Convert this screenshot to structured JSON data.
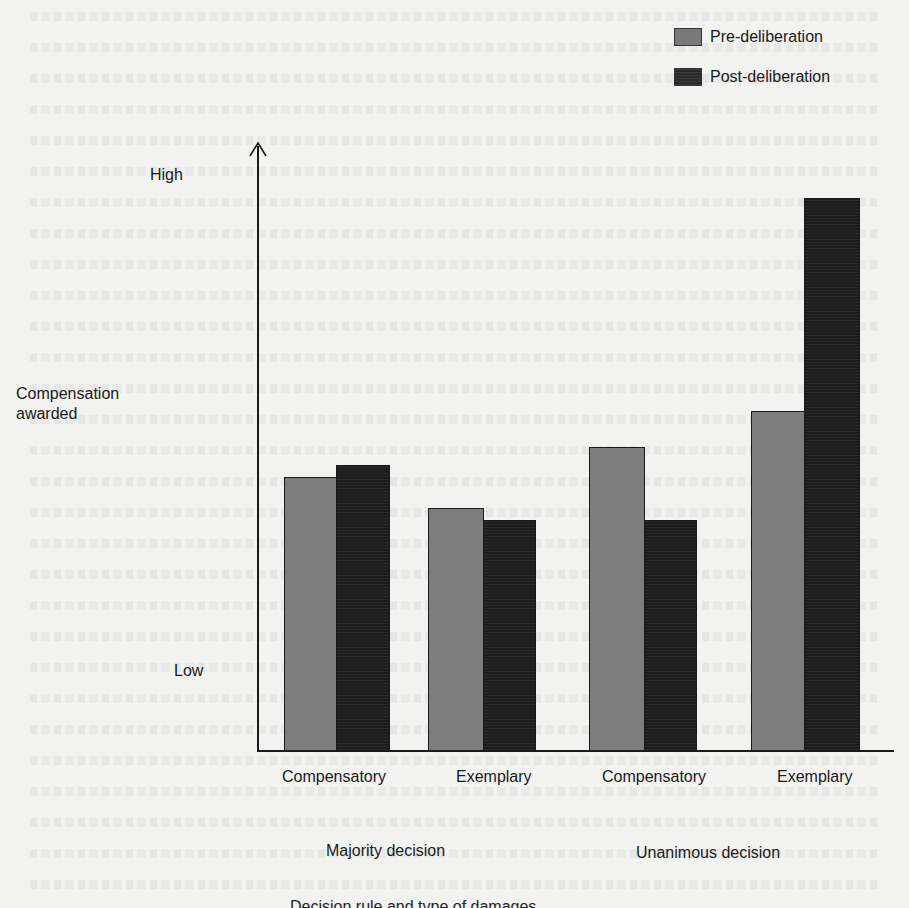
{
  "chart_data": {
    "type": "bar",
    "title": "",
    "ylabel": "Compensation awarded",
    "xlabel": "",
    "y_scale": "qualitative",
    "y_tick_labels": [
      "Low",
      "High"
    ],
    "ylim": [
      0,
      1
    ],
    "grid": false,
    "legend_position": "top-right",
    "categories": [
      "Compensatory",
      "Exemplary",
      "Compensatory",
      "Exemplary"
    ],
    "groups": [
      {
        "label": "Majority decision",
        "categories": [
          "Compensatory",
          "Exemplary"
        ]
      },
      {
        "label": "Unanimous decision",
        "categories": [
          "Compensatory",
          "Exemplary"
        ]
      }
    ],
    "series": [
      {
        "name": "Pre-deliberation",
        "color": "#7d7d7d",
        "values": [
          0.45,
          0.4,
          0.5,
          0.56
        ]
      },
      {
        "name": "Post-deliberation",
        "color": "#1c1c1c",
        "values": [
          0.47,
          0.38,
          0.38,
          0.91
        ]
      }
    ]
  },
  "legend": {
    "items": [
      {
        "label": "Pre-deliberation"
      },
      {
        "label": "Post-deliberation"
      }
    ]
  },
  "axis": {
    "y_title_line1": "Compensation",
    "y_title_line2": "awarded",
    "high": "High",
    "low": "Low"
  },
  "x_labels": [
    "Compensatory",
    "Exemplary",
    "Compensatory",
    "Exemplary"
  ],
  "group_labels": [
    "Majority decision",
    "Unanimous decision"
  ],
  "cutoff_text": "Decision rule and type of damages"
}
